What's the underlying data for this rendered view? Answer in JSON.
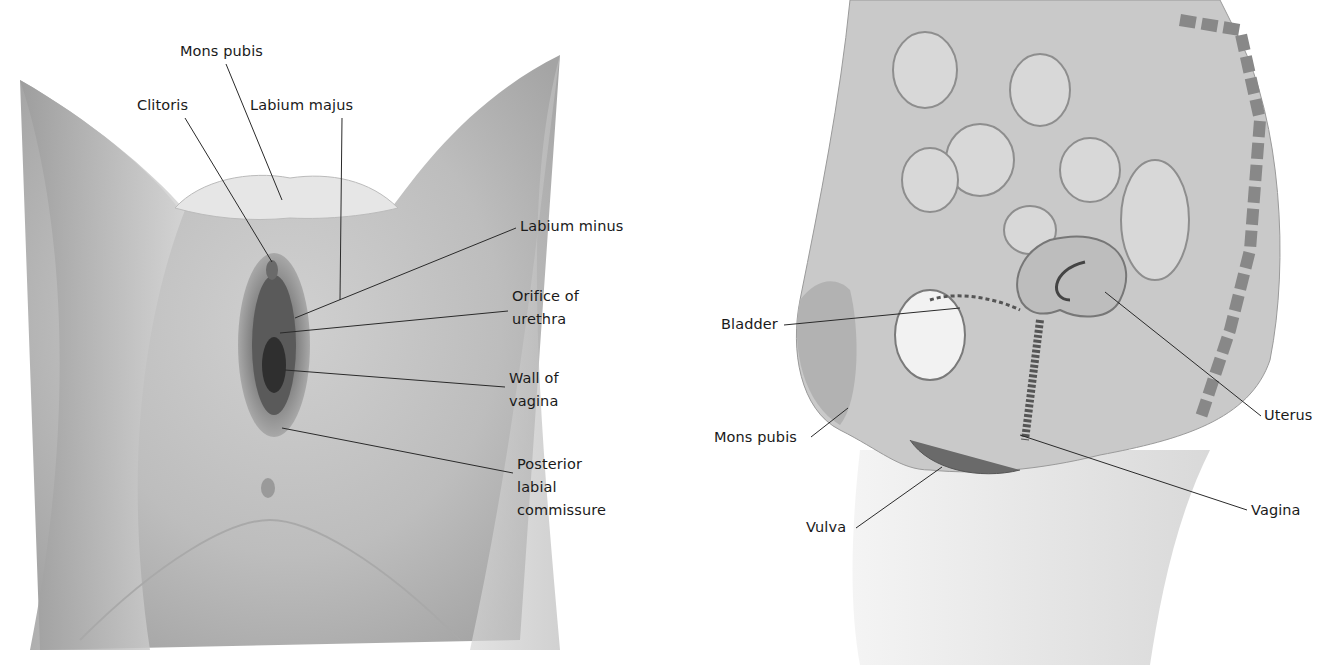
{
  "figure": {
    "left_diagram": {
      "view": "external female genitalia (anterior view)",
      "labels": [
        {
          "id": "mons-pubis",
          "text": "Mons pubis",
          "x": 180,
          "y": 40,
          "line": [
            [
              226,
              64
            ],
            [
              282,
              200
            ]
          ]
        },
        {
          "id": "clitoris",
          "text": "Clitoris",
          "x": 137,
          "y": 94,
          "line": [
            [
              185,
              118
            ],
            [
              272,
              262
            ]
          ]
        },
        {
          "id": "labium-majus",
          "text": "Labium majus",
          "x": 250,
          "y": 94,
          "line": [
            [
              342,
              118
            ],
            [
              340,
              300
            ]
          ]
        },
        {
          "id": "labium-minus",
          "text": "Labium minus",
          "x": 520,
          "y": 215,
          "line": [
            [
              516,
              228
            ],
            [
              295,
              318
            ]
          ]
        },
        {
          "id": "orifice-of-urethra",
          "text": "Orifice of\nurethra",
          "x": 512,
          "y": 285,
          "line": [
            [
              508,
              311
            ],
            [
              280,
              333
            ]
          ]
        },
        {
          "id": "wall-of-vagina",
          "text": "Wall of\nvagina",
          "x": 509,
          "y": 367,
          "line": [
            [
              505,
              387
            ],
            [
              285,
              370
            ]
          ]
        },
        {
          "id": "posterior-labial-commissure",
          "text": "Posterior\nlabial\ncommissure",
          "x": 517,
          "y": 453,
          "line": [
            [
              513,
              473
            ],
            [
              282,
              428
            ]
          ]
        }
      ]
    },
    "right_diagram": {
      "view": "sagittal section of female pelvis",
      "labels": [
        {
          "id": "bladder",
          "text": "Bladder",
          "x": 721,
          "y": 313,
          "line": [
            [
              784,
              325
            ],
            [
              960,
              308
            ]
          ]
        },
        {
          "id": "mons-pubis-sagittal",
          "text": "Mons pubis",
          "x": 714,
          "y": 426,
          "line": [
            [
              811,
              437
            ],
            [
              848,
              408
            ]
          ]
        },
        {
          "id": "uterus",
          "text": "Uterus",
          "x": 1264,
          "y": 410,
          "line": [
            [
              1261,
              416
            ],
            [
              1105,
              292
            ]
          ]
        },
        {
          "id": "vagina",
          "text": "Vagina",
          "x": 1251,
          "y": 502,
          "line": [
            [
              1247,
              510
            ],
            [
              1020,
              435
            ]
          ]
        },
        {
          "id": "vulva",
          "text": "Vulva",
          "x": 806,
          "y": 516,
          "line": [
            [
              856,
              528
            ],
            [
              942,
              467
            ]
          ]
        }
      ]
    }
  }
}
